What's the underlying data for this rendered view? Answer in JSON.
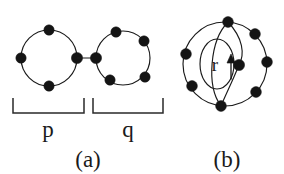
{
  "figure": {
    "background_color": "#ffffff",
    "ink_color": "#1a1a1a",
    "panels": [
      {
        "id": "panel-a",
        "caption": "(a)",
        "description": "two cycles joined by a bridge edge",
        "segments": [
          {
            "label": "p",
            "vertex_count": 4,
            "center": {
              "x": 49,
              "y": 58
            },
            "radius": 28,
            "vertex_angles_deg": [
              90,
              180,
              270,
              0
            ]
          },
          {
            "label": "q",
            "vertex_count": 5,
            "center": {
              "x": 123,
              "y": 58
            },
            "radius": 27,
            "vertex_angles_deg": [
              105,
              40,
              180,
              325,
              250
            ]
          }
        ],
        "bridge": {
          "from_x": 77,
          "from_y": 58,
          "to_x": 96,
          "to_y": 58
        },
        "braces": [
          {
            "label": "p",
            "left_x": 13,
            "right_x": 84,
            "top_y": 98,
            "bottom_y": 113,
            "label_x": 48,
            "label_y": 137
          },
          {
            "label": "q",
            "left_x": 93,
            "right_x": 163,
            "top_y": 98,
            "bottom_y": 113,
            "label_x": 128,
            "label_y": 137
          }
        ]
      },
      {
        "id": "panel-b",
        "caption": "(b)",
        "description": "single cycle with inner loop",
        "outer_cycle": {
          "vertex_count": 8,
          "center": {
            "x": 225,
            "y": 64
          },
          "radius": 42,
          "vertex_angles_deg": [
            100,
            45,
            0,
            318,
            265,
            210,
            165,
            140
          ]
        },
        "inner_loop": {
          "label": "r",
          "center": {
            "x": 217,
            "y": 64
          },
          "rx": 17,
          "ry": 25,
          "label_x": 215,
          "label_y": 71
        },
        "arrow": {
          "name": "loop-direction-arrow",
          "from_x": 231,
          "from_y": 78,
          "to_x": 231,
          "to_y": 57
        },
        "chord_vertices": [
          {
            "x": 228,
            "y": 22
          },
          {
            "x": 239,
            "y": 65
          },
          {
            "x": 221,
            "y": 106
          }
        ]
      }
    ],
    "captions": [
      {
        "text": "(a)",
        "x": 88,
        "y": 167
      },
      {
        "text": "(b)",
        "x": 227,
        "y": 167
      }
    ]
  }
}
